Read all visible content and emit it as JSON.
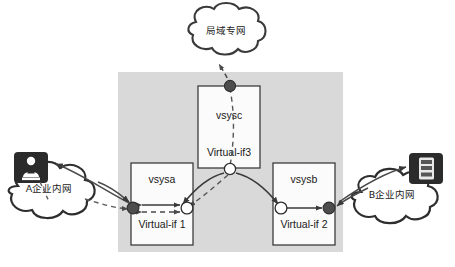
{
  "diagram": {
    "panel": {
      "name": "device-panel",
      "fill": "#d9d9d9"
    },
    "clouds": [
      {
        "id": "cloud-top",
        "label": "局域专网",
        "position": "top-center"
      },
      {
        "id": "cloud-left",
        "label": "A企业内网",
        "position": "left"
      },
      {
        "id": "cloud-right",
        "label": "B企业内网",
        "position": "right"
      }
    ],
    "hosts": [
      {
        "id": "host-left",
        "icon": "user-workstation-icon",
        "position": "top-left"
      },
      {
        "id": "host-right",
        "icon": "server-rack-icon",
        "position": "top-right"
      }
    ],
    "vsys_boxes": [
      {
        "id": "vsysa",
        "name": "vsysa",
        "interface": "Virtual-if 1"
      },
      {
        "id": "vsysb",
        "name": "vsysb",
        "interface": "Virtual-if 2"
      },
      {
        "id": "vsysc",
        "name": "vsysc",
        "interface": "Virtual-if3"
      }
    ],
    "nodes": [
      {
        "id": "node-vsysc-top",
        "style": "filled"
      },
      {
        "id": "node-vsysc-bottom",
        "style": "hollow"
      },
      {
        "id": "node-vsysa-left",
        "style": "filled"
      },
      {
        "id": "node-vsysa-right",
        "style": "hollow"
      },
      {
        "id": "node-vsysb-left",
        "style": "hollow"
      },
      {
        "id": "node-vsysb-right",
        "style": "filled"
      }
    ],
    "colors": {
      "panel_gray": "#d9d9d9",
      "box_fill": "#fbfbfb",
      "line": "#444444",
      "node_filled": "#4d4d4d",
      "node_hollow": "#ffffff",
      "icon_dark": "#2b2b2b",
      "text": "#1a1a1a"
    }
  }
}
